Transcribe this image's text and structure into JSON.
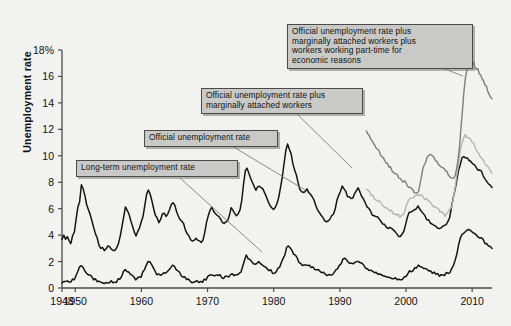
{
  "chart_data": {
    "type": "line",
    "title": "",
    "xlabel": "",
    "ylabel": "Unemployment rate",
    "xlim": [
      1948,
      2013
    ],
    "ylim": [
      0,
      18
    ],
    "grid": false,
    "legend_position": "annotations-on-plot",
    "y_ticks": [
      0,
      2,
      4,
      6,
      8,
      10,
      12,
      14,
      16,
      18
    ],
    "y_tick_labels": [
      "0",
      "2",
      "4",
      "6",
      "8",
      "10",
      "12",
      "14",
      "16",
      "18%"
    ],
    "x_ticks": [
      1948,
      1950,
      1960,
      1970,
      1980,
      1990,
      2000,
      2010
    ],
    "x_tick_labels": [
      "1948",
      "1950",
      "1960",
      "1970",
      "1980",
      "1990",
      "2000",
      "2010"
    ],
    "annotations": [
      {
        "name": "u6-callout",
        "text": "Official unemployment rate plus\nmarginally attached workers plus\nworkers working part-time for\neconomic reasons",
        "points_to_series": "U-6 official plus marginally attached plus part-time for economic reasons"
      },
      {
        "name": "u5-callout",
        "text": "Official unemployment rate plus\nmarginally attached workers",
        "points_to_series": "U-5 official plus marginally attached workers"
      },
      {
        "name": "u3-callout",
        "text": "Official unemployment rate",
        "points_to_series": "Official unemployment rate"
      },
      {
        "name": "long-term-callout",
        "text": "Long-term unemployment rate",
        "points_to_series": "Long-term unemployment rate"
      }
    ],
    "colors": {
      "official": "#141414",
      "long_term": "#141414",
      "u5": "#b4b4b4",
      "u6": "#7d7d7d",
      "axis": "#4a4a4a",
      "background": "#f2f2f0",
      "callout_fill": "#c9c9c7",
      "callout_border": "#4a4a4a"
    },
    "series": [
      {
        "name": "Official unemployment rate",
        "color": "#141414",
        "x_start": 1948,
        "x_end": 2013,
        "values": [
          3.8,
          4.0,
          3.7,
          3.9,
          3.6,
          3.4,
          3.9,
          4.2,
          5.2,
          6.2,
          6.6,
          7.9,
          7.6,
          6.9,
          6.4,
          5.8,
          5.5,
          5.0,
          4.5,
          4.2,
          3.7,
          3.2,
          3.1,
          3.0,
          2.9,
          3.0,
          3.1,
          3.2,
          3.0,
          2.8,
          2.9,
          3.1,
          3.4,
          4.0,
          4.7,
          5.4,
          6.1,
          5.9,
          5.5,
          5.2,
          4.7,
          4.2,
          4.0,
          4.2,
          4.5,
          5.0,
          5.5,
          6.3,
          7.1,
          7.4,
          7.1,
          6.6,
          6.0,
          5.5,
          5.2,
          5.0,
          5.3,
          5.6,
          5.6,
          5.5,
          5.7,
          6.0,
          6.3,
          6.5,
          6.2,
          5.8,
          5.4,
          5.2,
          5.0,
          4.8,
          4.5,
          4.2,
          3.9,
          3.7,
          3.5,
          3.6,
          3.8,
          3.6,
          3.5,
          3.4,
          3.6,
          4.2,
          4.9,
          5.5,
          5.9,
          6.0,
          5.9,
          5.7,
          5.5,
          5.4,
          5.2,
          4.9,
          4.8,
          4.9,
          5.1,
          5.6,
          6.0,
          5.8,
          5.6,
          5.5,
          5.6,
          5.9,
          6.6,
          7.8,
          8.9,
          9.0,
          8.6,
          8.3,
          7.9,
          7.6,
          7.4,
          7.6,
          7.8,
          7.7,
          7.5,
          7.2,
          6.9,
          6.5,
          6.2,
          6.0,
          5.9,
          6.0,
          6.3,
          6.9,
          7.5,
          8.3,
          9.4,
          10.4,
          10.8,
          10.4,
          10.1,
          9.5,
          9.0,
          8.5,
          8.0,
          7.5,
          7.3,
          7.3,
          7.2,
          7.4,
          7.2,
          7.0,
          6.8,
          6.6,
          6.3,
          6.0,
          5.7,
          5.5,
          5.4,
          5.2,
          5.1,
          5.0,
          5.2,
          5.4,
          5.6,
          6.0,
          6.6,
          7.0,
          7.4,
          7.8,
          7.6,
          7.3,
          7.0,
          6.9,
          6.8,
          6.9,
          7.2,
          7.4,
          7.5,
          7.3,
          7.0,
          6.8,
          6.5,
          6.2,
          6.0,
          5.8,
          5.6,
          5.5,
          5.4,
          5.3,
          5.2,
          5.0,
          4.9,
          4.8,
          4.7,
          4.6,
          4.5,
          4.4,
          4.3,
          4.2,
          4.1,
          4.0,
          4.0,
          4.1,
          4.3,
          4.7,
          5.3,
          5.7,
          5.8,
          5.9,
          6.0,
          6.1,
          6.3,
          6.0,
          5.8,
          5.6,
          5.4,
          5.2,
          5.1,
          5.0,
          4.9,
          4.7,
          4.6,
          4.5,
          4.4,
          4.5,
          4.6,
          4.7,
          4.9,
          5.0,
          5.4,
          6.1,
          6.8,
          7.3,
          8.1,
          8.9,
          9.4,
          9.8,
          10.0,
          9.9,
          9.8,
          9.7,
          9.6,
          9.5,
          9.4,
          9.1,
          9.0,
          8.9,
          8.8,
          8.5,
          8.2,
          8.1,
          7.9,
          7.8,
          7.6
        ]
      },
      {
        "name": "Long-term unemployment rate",
        "color": "#141414",
        "x_start": 1948,
        "x_end": 2013,
        "values": [
          0.4,
          0.4,
          0.4,
          0.5,
          0.5,
          0.5,
          0.6,
          0.7,
          0.9,
          1.2,
          1.5,
          1.7,
          1.6,
          1.4,
          1.2,
          1.0,
          0.9,
          0.8,
          0.7,
          0.6,
          0.5,
          0.5,
          0.4,
          0.4,
          0.4,
          0.4,
          0.4,
          0.5,
          0.5,
          0.5,
          0.5,
          0.5,
          0.6,
          0.7,
          0.9,
          1.2,
          1.4,
          1.3,
          1.1,
          1.0,
          0.9,
          0.8,
          0.7,
          0.7,
          0.8,
          0.9,
          1.1,
          1.4,
          1.8,
          2.1,
          2.0,
          1.8,
          1.5,
          1.3,
          1.1,
          1.0,
          1.0,
          1.1,
          1.1,
          1.2,
          1.3,
          1.4,
          1.6,
          1.7,
          1.6,
          1.4,
          1.2,
          1.1,
          1.0,
          0.9,
          0.8,
          0.7,
          0.6,
          0.6,
          0.5,
          0.5,
          0.5,
          0.5,
          0.5,
          0.5,
          0.5,
          0.6,
          0.7,
          0.8,
          0.9,
          0.9,
          0.9,
          0.9,
          0.9,
          0.9,
          0.9,
          0.8,
          0.8,
          0.8,
          0.8,
          0.9,
          1.0,
          1.0,
          1.0,
          1.0,
          1.0,
          1.1,
          1.3,
          1.7,
          2.1,
          2.4,
          2.3,
          2.2,
          2.0,
          1.9,
          1.8,
          1.8,
          1.9,
          1.9,
          1.8,
          1.7,
          1.6,
          1.5,
          1.4,
          1.3,
          1.2,
          1.2,
          1.3,
          1.4,
          1.6,
          1.9,
          2.2,
          2.6,
          3.0,
          3.1,
          3.0,
          2.8,
          2.6,
          2.4,
          2.2,
          2.0,
          1.9,
          1.8,
          1.8,
          1.8,
          1.8,
          1.7,
          1.6,
          1.6,
          1.5,
          1.4,
          1.3,
          1.2,
          1.1,
          1.1,
          1.0,
          1.0,
          1.0,
          1.0,
          1.1,
          1.2,
          1.3,
          1.5,
          1.7,
          1.9,
          2.1,
          2.2,
          2.1,
          2.0,
          1.9,
          1.9,
          1.9,
          1.9,
          2.0,
          2.0,
          1.9,
          1.8,
          1.7,
          1.6,
          1.5,
          1.4,
          1.3,
          1.3,
          1.2,
          1.2,
          1.1,
          1.1,
          1.0,
          1.0,
          0.9,
          0.9,
          0.9,
          0.8,
          0.8,
          0.8,
          0.7,
          0.7,
          0.7,
          0.7,
          0.7,
          0.8,
          0.9,
          1.0,
          1.2,
          1.3,
          1.4,
          1.5,
          1.6,
          1.7,
          1.6,
          1.5,
          1.4,
          1.4,
          1.3,
          1.3,
          1.2,
          1.2,
          1.1,
          1.1,
          1.0,
          1.0,
          1.0,
          1.0,
          1.0,
          1.1,
          1.1,
          1.2,
          1.4,
          1.7,
          2.1,
          2.6,
          3.2,
          3.7,
          4.0,
          4.2,
          4.3,
          4.4,
          4.4,
          4.3,
          4.2,
          4.1,
          4.0,
          3.9,
          3.8,
          3.7,
          3.6,
          3.4,
          3.3,
          3.2,
          3.1,
          3.0
        ]
      },
      {
        "name": "U-5 official plus marginally attached workers",
        "color": "#b4b4b4",
        "x_start": 1994,
        "x_end": 2013,
        "values": [
          7.4,
          7.3,
          7.2,
          7.0,
          6.9,
          6.8,
          6.7,
          6.6,
          6.5,
          6.4,
          6.3,
          6.2,
          6.1,
          6.0,
          5.9,
          5.8,
          5.7,
          5.6,
          5.5,
          5.5,
          5.4,
          5.4,
          5.5,
          5.8,
          6.2,
          6.5,
          6.7,
          6.8,
          6.9,
          7.0,
          7.0,
          7.1,
          7.1,
          7.0,
          6.9,
          6.8,
          6.7,
          6.6,
          6.5,
          6.4,
          6.2,
          6.1,
          6.0,
          5.9,
          5.8,
          5.7,
          5.6,
          5.5,
          5.6,
          5.7,
          5.9,
          6.2,
          6.8,
          7.6,
          8.5,
          9.4,
          10.3,
          10.9,
          11.3,
          11.5,
          11.4,
          11.3,
          11.2,
          11.1,
          10.9,
          10.7,
          10.4,
          10.2,
          10.0,
          9.8,
          9.6,
          9.4,
          9.2,
          9.0,
          8.9,
          8.8
        ]
      },
      {
        "name": "U-6 official plus marginally attached plus part-time for economic reasons",
        "color": "#7d7d7d",
        "x_start": 1994,
        "x_end": 2013,
        "values": [
          11.8,
          11.6,
          11.5,
          11.3,
          11.1,
          10.9,
          10.7,
          10.6,
          10.4,
          10.3,
          10.1,
          10.0,
          9.8,
          9.7,
          9.5,
          9.4,
          9.2,
          9.1,
          9.0,
          8.8,
          8.7,
          8.6,
          8.5,
          8.4,
          8.3,
          8.2,
          8.1,
          8.0,
          7.9,
          7.8,
          7.7,
          7.6,
          7.5,
          7.4,
          7.3,
          7.2,
          7.1,
          7.3,
          7.8,
          8.4,
          8.9,
          9.3,
          9.6,
          9.8,
          10.0,
          10.1,
          10.0,
          9.9,
          9.8,
          9.7,
          9.6,
          9.4,
          9.3,
          9.2,
          9.1,
          9.0,
          8.9,
          8.8,
          8.6,
          8.5,
          8.4,
          8.3,
          8.4,
          8.6,
          9.0,
          9.8,
          10.8,
          12.0,
          13.4,
          14.8,
          15.8,
          16.4,
          16.8,
          17.1,
          17.0,
          16.8,
          17.0,
          16.6,
          16.5,
          16.7,
          16.2,
          16.0,
          15.9,
          15.7,
          15.4,
          15.2,
          14.9,
          14.7,
          14.5,
          14.3
        ]
      }
    ]
  }
}
